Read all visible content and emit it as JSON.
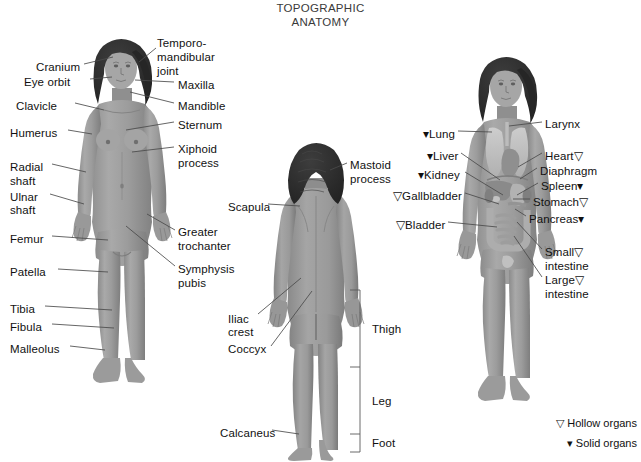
{
  "title": {
    "line1": "TOPOGRAPHIC",
    "line2": "ANATOMY"
  },
  "colors": {
    "background": "#ffffff",
    "skin": "#9a9a9a",
    "skin_light": "#b4b4b4",
    "skin_shadow": "#7d7d7d",
    "hair": "#2e2e2e",
    "organ_light": "#c3c3c3",
    "organ_mid": "#a8a8a8",
    "organ_dark": "#8a8a8a",
    "leader_line": "#4a4a4a",
    "text": "#111111"
  },
  "figures": {
    "anterior_skeletal": {
      "name": "Anterior view - skeletal landmarks",
      "labels_left": [
        {
          "text": "Cranium",
          "x": 36,
          "y": 68,
          "anchor_x": 113,
          "anchor_y": 62
        },
        {
          "text": "Eye orbit",
          "x": 24,
          "y": 83,
          "anchor_x": 110,
          "anchor_y": 80
        },
        {
          "text": "Clavicle",
          "x": 16,
          "y": 107,
          "anchor_x": 100,
          "anchor_y": 112
        },
        {
          "text": "Humerus",
          "x": 10,
          "y": 134,
          "anchor_x": 95,
          "anchor_y": 137
        },
        {
          "text": "Radial",
          "x": 10,
          "y": 168,
          "anchor_x": 85,
          "anchor_y": 170
        },
        {
          "text": "shaft",
          "x": 10,
          "y": 182
        },
        {
          "text": "Ulnar",
          "x": 10,
          "y": 198,
          "anchor_x": 83,
          "anchor_y": 200
        },
        {
          "text": "shaft",
          "x": 10,
          "y": 211
        },
        {
          "text": "Femur",
          "x": 10,
          "y": 240,
          "anchor_x": 105,
          "anchor_y": 242
        },
        {
          "text": "Patella",
          "x": 10,
          "y": 273,
          "anchor_x": 104,
          "anchor_y": 275
        },
        {
          "text": "Tibia",
          "x": 10,
          "y": 310,
          "anchor_x": 108,
          "anchor_y": 312
        },
        {
          "text": "Fibula",
          "x": 10,
          "y": 328,
          "anchor_x": 110,
          "anchor_y": 330
        },
        {
          "text": "Malleolus",
          "x": 10,
          "y": 350,
          "anchor_x": 100,
          "anchor_y": 352
        }
      ],
      "labels_right": [
        {
          "text": "Temporo-",
          "x": 157,
          "y": 44,
          "anchor_x": 143,
          "anchor_y": 60
        },
        {
          "text": "mandibular",
          "x": 157,
          "y": 58
        },
        {
          "text": "joint",
          "x": 157,
          "y": 72
        },
        {
          "text": "Maxilla",
          "x": 178,
          "y": 86,
          "anchor_x": 132,
          "anchor_y": 82
        },
        {
          "text": "Mandible",
          "x": 178,
          "y": 107,
          "anchor_x": 128,
          "anchor_y": 94
        },
        {
          "text": "Sternum",
          "x": 178,
          "y": 126,
          "anchor_x": 122,
          "anchor_y": 129
        },
        {
          "text": "Xiphoid",
          "x": 178,
          "y": 150,
          "anchor_x": 128,
          "anchor_y": 153
        },
        {
          "text": "process",
          "x": 178,
          "y": 164
        },
        {
          "text": "Greater",
          "x": 178,
          "y": 233,
          "anchor_x": 146,
          "anchor_y": 215
        },
        {
          "text": "trochanter",
          "x": 178,
          "y": 247
        },
        {
          "text": "Symphysis",
          "x": 178,
          "y": 270,
          "anchor_x": 124,
          "anchor_y": 228
        },
        {
          "text": "pubis",
          "x": 178,
          "y": 284
        }
      ]
    },
    "posterior": {
      "name": "Posterior view",
      "labels_left": [
        {
          "text": "Scapula",
          "x": 228,
          "y": 208,
          "anchor_x": 300,
          "anchor_y": 208
        },
        {
          "text": "Iliac",
          "x": 228,
          "y": 320,
          "anchor_x": 300,
          "anchor_y": 280
        },
        {
          "text": "crest",
          "x": 228,
          "y": 333
        },
        {
          "text": "Coccyx",
          "x": 228,
          "y": 350,
          "anchor_x": 311,
          "anchor_y": 292
        },
        {
          "text": "Calcaneus",
          "x": 220,
          "y": 434,
          "anchor_x": 300,
          "anchor_y": 434
        }
      ],
      "labels_right": [
        {
          "text": "Mastoid",
          "x": 350,
          "y": 166,
          "anchor_x": 330,
          "anchor_y": 170
        },
        {
          "text": "process",
          "x": 350,
          "y": 180
        }
      ],
      "brackets": [
        {
          "text": "Thigh",
          "x": 372,
          "y": 330,
          "top": 290,
          "bottom": 367
        },
        {
          "text": "Leg",
          "x": 372,
          "y": 402,
          "top": 367,
          "bottom": 434
        },
        {
          "text": "Foot",
          "x": 372,
          "y": 444,
          "top": 434,
          "bottom": 452
        }
      ]
    },
    "organs": {
      "name": "Anterior view - internal organs",
      "labels_left": [
        {
          "text": "▾Lung",
          "x": 423,
          "y": 135,
          "anchor_x": 492,
          "anchor_y": 133
        },
        {
          "text": "▾Liver",
          "x": 427,
          "y": 157,
          "anchor_x": 500,
          "anchor_y": 180
        },
        {
          "text": "▾Kidney",
          "x": 418,
          "y": 176,
          "anchor_x": 503,
          "anchor_y": 196
        },
        {
          "text": "▽Gallbladder",
          "x": 393,
          "y": 197,
          "anchor_x": 500,
          "anchor_y": 205
        },
        {
          "text": "▽Bladder",
          "x": 396,
          "y": 226,
          "anchor_x": 497,
          "anchor_y": 228
        }
      ],
      "labels_right": [
        {
          "text": "Larynx",
          "x": 545,
          "y": 125,
          "anchor_x": 509,
          "anchor_y": 126
        },
        {
          "text": "Heart▽",
          "x": 545,
          "y": 157,
          "anchor_x": 517,
          "anchor_y": 168
        },
        {
          "text": "Diaphragm",
          "x": 540,
          "y": 172,
          "anchor_x": 519,
          "anchor_y": 180
        },
        {
          "text": "Spleen▾",
          "x": 541,
          "y": 187,
          "anchor_x": 516,
          "anchor_y": 196
        },
        {
          "text": "Stomach▽",
          "x": 533,
          "y": 203,
          "anchor_x": 512,
          "anchor_y": 200
        },
        {
          "text": "Pancreas▾",
          "x": 529,
          "y": 220,
          "anchor_x": 514,
          "anchor_y": 210
        },
        {
          "text": "Small▽",
          "x": 545,
          "y": 253,
          "anchor_x": 516,
          "anchor_y": 222
        },
        {
          "text": "intestine",
          "x": 545,
          "y": 267
        },
        {
          "text": "Large▽",
          "x": 545,
          "y": 281,
          "anchor_x": 513,
          "anchor_y": 236
        },
        {
          "text": "intestine",
          "x": 545,
          "y": 295
        }
      ]
    }
  },
  "legend": {
    "hollow": "▽ Hollow organs",
    "solid": "▾ Solid organs",
    "hollow_y": 424,
    "solid_y": 444
  }
}
